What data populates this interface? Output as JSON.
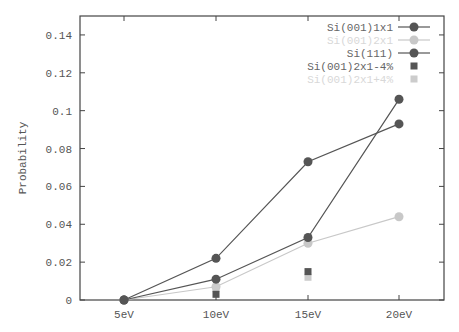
{
  "chart_data": {
    "type": "line",
    "title": "",
    "xlabel": "",
    "ylabel": "Probability",
    "categories": [
      "5eV",
      "10eV",
      "15eV",
      "20eV"
    ],
    "ylim": [
      0,
      0.15
    ],
    "yticks": [
      "0",
      "0.02",
      "0.04",
      "0.06",
      "0.08",
      "0.1",
      "0.12",
      "0.14"
    ],
    "grid": false,
    "legend_position": "top-right",
    "series": [
      {
        "name": "Si(001)1x1",
        "style": "line-circle",
        "color": "#555555",
        "values": [
          0,
          0.011,
          0.033,
          0.106
        ]
      },
      {
        "name": "Si(001)2x1",
        "style": "line-circle",
        "color": "#c8c8c8",
        "values": [
          0,
          0.007,
          0.03,
          0.044
        ]
      },
      {
        "name": "Si(111)",
        "style": "line-circle",
        "color": "#555555",
        "values": [
          0,
          0.022,
          0.073,
          0.093
        ]
      },
      {
        "name": "Si(001)2x1-4%",
        "style": "square",
        "color": "#555555",
        "values": [
          null,
          0.003,
          0.015,
          null
        ]
      },
      {
        "name": "Si(001)2x1+4%",
        "style": "square",
        "color": "#cccccc",
        "values": [
          null,
          0.006,
          0.012,
          null
        ]
      }
    ]
  }
}
